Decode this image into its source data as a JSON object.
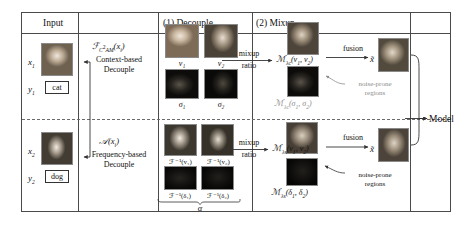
{
  "figure": {
    "panels": [
      {
        "id": "input",
        "header": "Input"
      },
      {
        "id": "decouple",
        "header": "(1) Decouple"
      },
      {
        "id": "mixup",
        "header": "(2) Mixup"
      }
    ]
  },
  "input": {
    "sample1": {
      "x_label": "x",
      "x_sub": "1",
      "y_label": "y",
      "y_sub": "1",
      "class_name": "cat"
    },
    "sample2": {
      "x_label": "x",
      "x_sub": "2",
      "y_label": "y",
      "y_sub": "2",
      "class_name": "dog"
    }
  },
  "decouple": {
    "context": {
      "operator": "ℱ",
      "operator_sub": "C²AM",
      "operator_arg": "(xᵢ)",
      "name_line1": "Context-based",
      "name_line2": "Decouple",
      "outputs_top": [
        "v₁",
        "v₂"
      ],
      "outputs_bottom": [
        "σ₁",
        "σ₂"
      ]
    },
    "frequency": {
      "operator": "𝒜",
      "operator_arg": "(xᵢ)",
      "name_line1": "Frequency-based",
      "name_line2": "Decouple",
      "outputs_top": [
        "ℱ⁻¹(v₁)",
        "ℱ⁻¹(v₂)"
      ],
      "outputs_bottom": [
        "ℱ⁻¹(δ₁)",
        "ℱ⁻¹(δ₂)"
      ],
      "brace_label": "α"
    }
  },
  "mixup": {
    "top": {
      "ratio_line1": "mixup",
      "ratio_line2": "ratio",
      "mix_main": "ℳλс(v₁, v₂)",
      "mix_main_base": "ℳ",
      "mix_main_sub": "λᴄ",
      "mix_main_args": "(v₁, v₂)",
      "mix_noise_base": "ℳ",
      "mix_noise_sub": "λᴄ",
      "mix_noise_args": "(σ₁, σ₂)",
      "fusion_label": "fusion",
      "noise_note_line1": "noise-prone",
      "noise_note_line2": "regions",
      "output_symbol": "x̃"
    },
    "bottom": {
      "ratio_line1": "mixup",
      "ratio_line2": "ratio",
      "mix_main_base": "ℳ",
      "mix_main_sub": "λₛ",
      "mix_main_args": "(v₁, v₂)",
      "mix_noise_base": "ℳ",
      "mix_noise_sub": "λₛ",
      "mix_noise_args": "(δ₁, δ₂)",
      "fusion_label": "fusion",
      "noise_note_line1": "noise-prone",
      "noise_note_line2": "regions",
      "output_symbol": "x̃"
    }
  },
  "model": {
    "label": "Model"
  },
  "colors": {
    "frame_stroke": "#4a4a4a",
    "arrow": "#333333",
    "divider_dashed": "#6a6a6a",
    "background": "#ffffff",
    "text": "#111111"
  }
}
